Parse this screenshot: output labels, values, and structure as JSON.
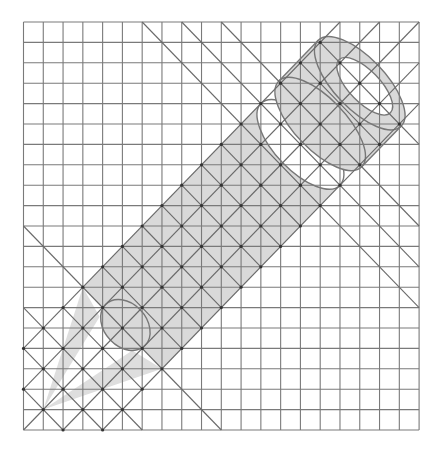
{
  "diagram": {
    "title": "Pencil drawn on an isometric helper grid",
    "canvas": {
      "width": 442,
      "height": 451,
      "background": "#ffffff"
    },
    "grid": {
      "x0": 23.5,
      "y0": 22,
      "cols": 20,
      "rows": 20,
      "cell_w": 19.78,
      "cell_h": 20.4,
      "line_color": "#7a7a7a"
    },
    "diagonals": {
      "line_color": "#6a6a6a",
      "slash_lines_t": [
        16,
        18,
        20,
        22,
        24
      ],
      "backslash_lines_s_in_band": [
        -18,
        -16,
        -14,
        -12,
        -10,
        -8,
        -6,
        -4,
        -2,
        0,
        2,
        4,
        6,
        8,
        10,
        12,
        14
      ],
      "backslash_lines_s_full": [
        -18,
        -16,
        -14,
        -10,
        6,
        8,
        10
      ],
      "backslash_lines_s_to_right": [
        14
      ],
      "band_t": [
        16,
        24
      ],
      "node_color": "#333333"
    },
    "pencil": {
      "fill": "#d9d9d9",
      "cone_fill": "#dedede",
      "outline": "#777777",
      "body": {
        "s": [
          -10,
          8
        ],
        "t": [
          16,
          24
        ]
      },
      "tip_apex": {
        "s": -18,
        "t": 20
      },
      "cone_base_ellipse": {
        "s": -9.2,
        "t": 20,
        "rs": 1.2,
        "rt": 2
      },
      "cone_left_wedge": [
        [
          -18,
          20
        ],
        [
          -10,
          16
        ],
        [
          -10.6,
          18.3
        ]
      ],
      "cone_bottom_wedge": [
        [
          -18,
          20
        ],
        [
          -10,
          24
        ],
        [
          -10.6,
          21.6
        ]
      ],
      "body_end_ellipse": {
        "s": 8,
        "t": 20,
        "rs": 1.8,
        "rt": 4
      },
      "ferrule": {
        "s": [
          10,
          14
        ],
        "t": [
          15.8,
          24.2
        ],
        "rs": 1.8
      },
      "eraser_hole": {
        "s": 14.1,
        "t": 20.4,
        "rs": 1.1,
        "rt": 2.6
      }
    }
  }
}
